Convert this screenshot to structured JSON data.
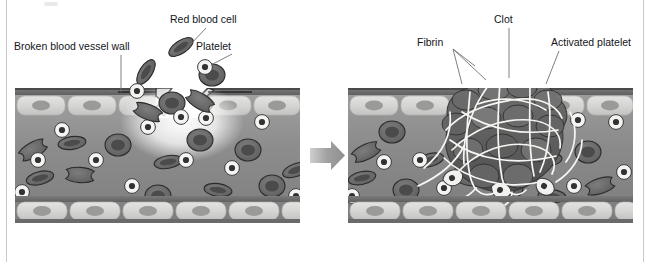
{
  "figure": {
    "type": "two-panel biology process diagram",
    "transition_icon": "right-arrow-icon"
  },
  "panels": [
    {
      "id": "before",
      "caption": "Damaged vessel with escaping blood cells and platelets",
      "labels": [
        {
          "key": "broken_wall",
          "text": "Broken blood vessel wall"
        },
        {
          "key": "rbc",
          "text": "Red blood cell"
        },
        {
          "key": "platelet",
          "text": "Platelet"
        }
      ]
    },
    {
      "id": "after",
      "caption": "Clot sealing the break",
      "labels": [
        {
          "key": "fibrin",
          "text": "Fibrin"
        },
        {
          "key": "clot",
          "text": "Clot"
        },
        {
          "key": "activated_platelet",
          "text": "Activated platelet"
        }
      ]
    }
  ],
  "colors": {
    "background": "#ffffff",
    "text": "#14161a",
    "leader_line": "#6d7378",
    "wall_band_dark": "#6e6e6e",
    "wall_band_edge": "#4a4a4a",
    "endothelial_cell": "#d8d8d6",
    "endothelial_nucleus": "#9a9a98",
    "lumen": "#8e8e8e",
    "rbc_body": "#6f6f6f",
    "rbc_core": "#4e4e4e",
    "rbc_outline": "#2e2e2e",
    "platelet_body": "#f2f2f0",
    "platelet_core": "#3a3a3a",
    "fibrin_strand": "#f5f5f2",
    "clot_mass": "#5b5b5b",
    "arrow": "#9d9d9d",
    "glow": "#ffffff",
    "frame_rule": "#c9c9c9"
  }
}
